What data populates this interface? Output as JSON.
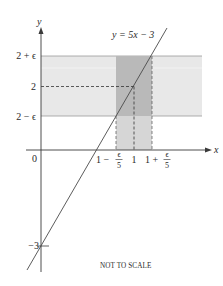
{
  "diagram": {
    "type": "epsilon-delta-limit-illustration",
    "line_label": "y = 5x − 3",
    "axes": {
      "x_label": "x",
      "y_label": "y",
      "origin_label": "0"
    },
    "y_ticks": [
      {
        "label": "2 + ϵ",
        "value": "2+eps"
      },
      {
        "label": "2",
        "value": "2"
      },
      {
        "label": "2 − ϵ",
        "value": "2-eps"
      },
      {
        "label": "−3",
        "value": "-3"
      }
    ],
    "x_ticks": [
      {
        "label_prefix": "1 −",
        "frac_num": "ϵ",
        "frac_den": "5",
        "value": "1-eps/5"
      },
      {
        "label": "1",
        "value": "1"
      },
      {
        "label_prefix": "1 +",
        "frac_num": "ϵ",
        "frac_den": "5",
        "value": "1+eps/5"
      }
    ],
    "caption": "NOT TO SCALE",
    "colors": {
      "horizontal_band": "#e8e8e8",
      "vertical_band": "#d6d6d6",
      "overlap": "#b9b9b9",
      "band_border": "#9a9a9a",
      "line": "#4a4a4a",
      "axis": "#3a3a3a"
    }
  }
}
